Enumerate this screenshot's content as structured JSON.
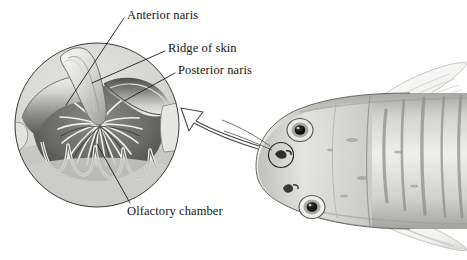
{
  "figure": {
    "background_color": "#ffffff",
    "width": 467,
    "height": 260
  },
  "labels": {
    "anterior_naris": "Anterior naris",
    "ridge_of_skin": "Ridge of skin",
    "posterior_naris": "Posterior naris",
    "olfactory_chamber": "Olfactory chamber"
  },
  "inset": {
    "name": "circular-cutaway-inset",
    "shape": "circle",
    "center_x": 97,
    "center_y": 125,
    "radius": 83,
    "fill_color": "#d8d8d6",
    "outline_color": "#3a3a38",
    "description": "Cutaway circular enlargement of the nasal pit showing the anterior naris, ridge of skin, posterior naris and the rosette of olfactory lamellae"
  },
  "fish": {
    "name": "fish-head-dorsal-view",
    "body_color": "#c9c9c7",
    "highlight_color": "#efefed",
    "marking_color": "#8e8e8c",
    "outline_color": "#55544f",
    "eyes": [
      {
        "name": "upper-eye",
        "cx": 300,
        "cy": 130,
        "r": 12
      },
      {
        "name": "lower-eye",
        "cx": 312,
        "cy": 207,
        "r": 12
      }
    ],
    "nostrils": [
      {
        "name": "highlighted-nostril",
        "cx": 281,
        "cy": 155,
        "circled": true
      },
      {
        "name": "second-nostril",
        "cx": 288,
        "cy": 188,
        "circled": false
      }
    ]
  },
  "arrow": {
    "name": "magnify-arrow",
    "direction": "left",
    "style": "outlined-curved",
    "stroke_color": "#4a4a47",
    "fill_color": "#ffffff"
  },
  "leader_lines": {
    "stroke_color": "#1c1b19",
    "stroke_width": 0.9,
    "count": 4
  },
  "colors": {
    "ink": "#161513",
    "paper": "#ffffff",
    "shadow": "#6f6f6c",
    "midtone": "#a5a5a2",
    "lamella_dark": "#5e5e5b",
    "lamella_light": "#e9e9e6"
  }
}
